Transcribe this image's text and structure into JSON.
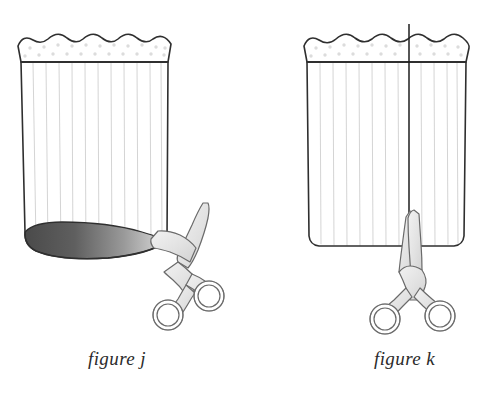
{
  "illustration": {
    "title": "Two-panel sewing instruction diagram: cutting a pleated polka-dot skirt",
    "background_color": "#ffffff",
    "panels": [
      {
        "id": "panel-j",
        "caption": "figure j",
        "caption_position": {
          "x": 88,
          "y": 348
        },
        "garment": {
          "name": "pleated-skirt",
          "view": "three-quarter-open-tube",
          "outline_color": "#2f2f2f",
          "fill_color": "#ffffff",
          "pleat_line_color": "#cfcfcf",
          "pleat_count": 11,
          "waistband": {
            "name": "scalloped-waistband",
            "scallop_count": 5,
            "dot_color": "#d8d8d8",
            "dot_count": 22,
            "band_line_y": 62
          },
          "hem": {
            "type": "open-ellipse-interior",
            "gradient_from": "#4a4a4a",
            "gradient_to": "#d8d8d8"
          }
        },
        "scissors": {
          "name": "scissors-horizontal-cut",
          "orientation": "diagonal-cutting-hem",
          "blade_fill": "#e6e6e6",
          "outline_color": "#6a6a6a",
          "handle_rings": 2
        },
        "cut_line": null
      },
      {
        "id": "panel-k",
        "caption": "figure k",
        "caption_position": {
          "x": 374,
          "y": 348
        },
        "garment": {
          "name": "pleated-skirt",
          "view": "flat-front",
          "outline_color": "#2f2f2f",
          "fill_color": "#ffffff",
          "pleat_line_color": "#cfcfcf",
          "pleat_count": 12,
          "waistband": {
            "name": "scalloped-waistband",
            "scallop_count": 5,
            "dot_color": "#d8d8d8",
            "dot_count": 22,
            "band_line_y": 62
          },
          "hem": {
            "type": "flat-hem-line",
            "gradient_from": null,
            "gradient_to": null
          }
        },
        "scissors": {
          "name": "scissors-vertical-cut",
          "orientation": "upright-cutting-upward",
          "blade_fill": "#e6e6e6",
          "outline_color": "#6a6a6a",
          "handle_rings": 2
        },
        "cut_line": {
          "name": "vertical-cut-guide-line",
          "color": "#1e1e1e",
          "x": 409,
          "y_top": 24,
          "y_bottom": 247
        }
      }
    ]
  }
}
